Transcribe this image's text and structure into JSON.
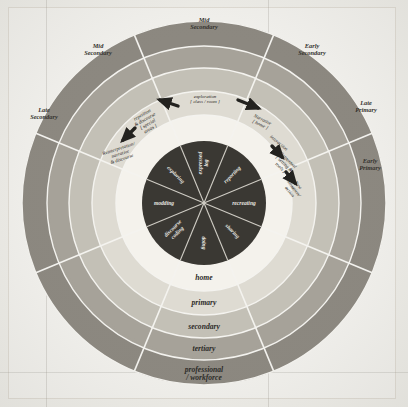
{
  "figure": {
    "background_color": "#edece7",
    "paper_color": "#f1f0ec"
  },
  "rings": [
    {
      "id": "home",
      "label": "home",
      "color": "#f4f2ec",
      "inner_radius": 62,
      "outer_radius": 88
    },
    {
      "id": "primary",
      "label": "primary",
      "color": "#dedbd2",
      "inner_radius": 88,
      "outer_radius": 112
    },
    {
      "id": "secondary",
      "label": "secondary",
      "color": "#c3c0b6",
      "inner_radius": 112,
      "outer_radius": 135
    },
    {
      "id": "tertiary",
      "label": "tertiary",
      "color": "#a6a299",
      "inner_radius": 135,
      "outer_radius": 157
    },
    {
      "id": "professional",
      "label": "professional / workforce",
      "color": "#8c8880",
      "inner_radius": 157,
      "outer_radius": 182
    }
  ],
  "hub": {
    "color": "#3a3833",
    "radius": 62,
    "segments": [
      {
        "label": "expressed log",
        "angle_deg": -90
      },
      {
        "label": "reporting",
        "angle_deg": -45
      },
      {
        "label": "recreating",
        "angle_deg": 0
      },
      {
        "label": "sharing",
        "angle_deg": 45
      },
      {
        "label": "doing",
        "angle_deg": 90
      },
      {
        "label": "discourse coding",
        "angle_deg": 135
      },
      {
        "label": "modding",
        "angle_deg": 180
      },
      {
        "label": "exploring",
        "angle_deg": -135
      }
    ]
  },
  "stage_labels": [
    {
      "id": "mid-secondary-top",
      "label": "Mid Secondary",
      "x": 204,
      "y": 22
    },
    {
      "id": "mid-secondary-left",
      "label": "Mid Secondary",
      "x": 98,
      "y": 48
    },
    {
      "id": "early-secondary",
      "label": "Early Secondary",
      "x": 312,
      "y": 48
    },
    {
      "id": "late-secondary",
      "label": "Late Secondary",
      "x": 44,
      "y": 112
    },
    {
      "id": "late-primary",
      "label": "Late Primary",
      "x": 366,
      "y": 105
    },
    {
      "id": "early-primary",
      "label": "Early Primary",
      "x": 370,
      "y": 163
    }
  ],
  "annotations": [
    {
      "id": "exploration",
      "lines": [
        "exploration",
        "[ class / room ]"
      ],
      "x": 205,
      "y": 98,
      "rotate": 0
    },
    {
      "id": "repetition",
      "lines": [
        "repetition",
        "& discourse",
        "[ special",
        "areas ]"
      ],
      "x": 143,
      "y": 116,
      "rotate": -30
    },
    {
      "id": "reinterpret",
      "lines": [
        "Reinterpretation/",
        "narrative",
        "& discourse"
      ],
      "x": 119,
      "y": 150,
      "rotate": -18
    },
    {
      "id": "narrative",
      "lines": [
        "Narrative",
        "[ home ]"
      ],
      "x": 262,
      "y": 121,
      "rotate": 26
    },
    {
      "id": "interaction",
      "lines": [
        "interaction"
      ],
      "x": 278,
      "y": 144,
      "rotate": 40
    },
    {
      "id": "contextual",
      "lines": [
        "Contextual",
        "[ setting &",
        "tools ]"
      ],
      "x": 287,
      "y": 161,
      "rotate": 44
    },
    {
      "id": "newsituation",
      "lines": [
        "New",
        "Situation/",
        "action"
      ],
      "x": 297,
      "y": 186,
      "rotate": 52
    }
  ],
  "arrows": [
    {
      "id": "arrow-exploration-left",
      "x1": 178,
      "y1": 106,
      "x2": 160,
      "y2": 100
    },
    {
      "id": "arrow-exploration-right",
      "x1": 238,
      "y1": 100,
      "x2": 258,
      "y2": 108
    },
    {
      "id": "arrow-repetition",
      "x1": 135,
      "y1": 128,
      "x2": 123,
      "y2": 140
    },
    {
      "id": "arrow-interaction",
      "x1": 272,
      "y1": 146,
      "x2": 282,
      "y2": 157
    },
    {
      "id": "arrow-newsituation",
      "x1": 286,
      "y1": 172,
      "x2": 295,
      "y2": 183
    }
  ]
}
